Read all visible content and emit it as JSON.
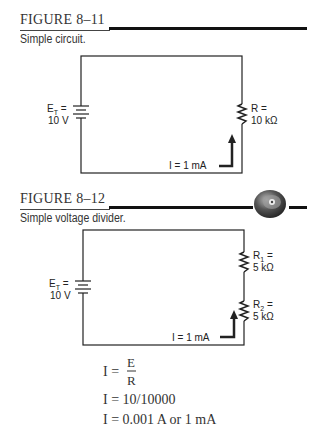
{
  "figures": [
    {
      "number": "FIGURE 8–11",
      "caption": "Simple circuit.",
      "source": {
        "label": "E",
        "subscript": "T",
        "equals": "=",
        "value": "10 V"
      },
      "resistors": [
        {
          "label": "R =",
          "value": "10 kΩ"
        }
      ],
      "current": "I = 1 mA"
    },
    {
      "number": "FIGURE 8–12",
      "caption": "Simple voltage divider.",
      "icon": "cd-disc-icon",
      "source": {
        "label": "E",
        "subscript": "T",
        "equals": "=",
        "value": "10 V"
      },
      "resistors": [
        {
          "label": "R",
          "subscript": "1",
          "equals": "=",
          "value": "5 kΩ"
        },
        {
          "label": "R",
          "subscript": "2",
          "equals": "=",
          "value": "5 kΩ"
        }
      ],
      "current": "I = 1 mA"
    }
  ],
  "equations": {
    "line1_lhs": "I =",
    "line1_num": "E",
    "line1_den": "R",
    "line2": "I = 10/10000",
    "line3": "I = 0.001 A or 1 mA"
  }
}
